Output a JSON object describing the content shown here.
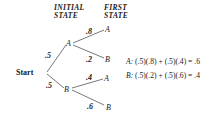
{
  "headers": {
    "initial_line1": "INITIAL",
    "initial_line2": "STATE",
    "first_line1": "FIRST",
    "first_line2": "STATE"
  },
  "tree": {
    "root": "Start",
    "level1": [
      {
        "node": "A",
        "prob": ".5"
      },
      {
        "node": "B",
        "prob": ".5"
      }
    ],
    "level2": [
      {
        "parent": "A",
        "node": "A",
        "prob": ".8"
      },
      {
        "parent": "A",
        "node": "B",
        "prob": ".2"
      },
      {
        "parent": "B",
        "node": "A",
        "prob": ".4"
      },
      {
        "parent": "B",
        "node": "B",
        "prob": ".6"
      }
    ]
  },
  "equations": [
    {
      "state": "A:",
      "expr": "(.5)(.8) + (.5)(.4) = .6"
    },
    {
      "state": "B:",
      "expr": "(.5)(.2) + (.5)(.6) = .4"
    }
  ],
  "colors": {
    "line": "#555555",
    "text": "#1a1a1a"
  }
}
